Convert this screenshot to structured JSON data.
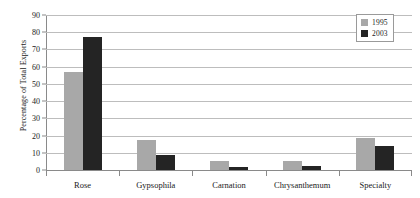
{
  "chart_data": {
    "type": "bar",
    "title": "",
    "xlabel": "",
    "ylabel": "Percentage of Total Exports",
    "ylim": [
      0,
      90
    ],
    "yticks": [
      0,
      10,
      20,
      30,
      40,
      50,
      60,
      70,
      80,
      90
    ],
    "grid": true,
    "legend_position": "top-right",
    "categories": [
      "Rose",
      "Gypsophila",
      "Carnation",
      "Chrysanthemum",
      "Specialty"
    ],
    "series": [
      {
        "name": "1995",
        "color": "#a8a8a8",
        "values": [
          57,
          17.5,
          5.5,
          5,
          18.5
        ]
      },
      {
        "name": "2003",
        "color": "#242424",
        "values": [
          77,
          8.5,
          2,
          2.5,
          14
        ]
      }
    ]
  },
  "legend": {
    "items": [
      {
        "label": "1995"
      },
      {
        "label": "2003"
      }
    ]
  }
}
